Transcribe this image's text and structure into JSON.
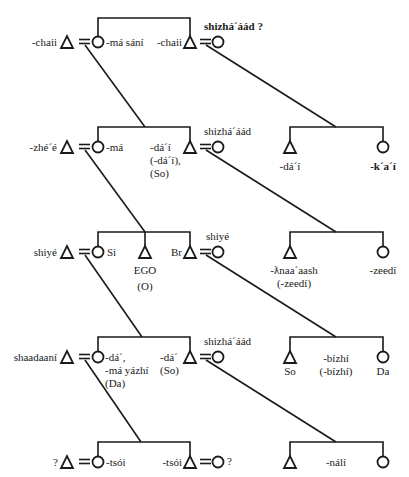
{
  "diagram": {
    "type": "kinship-chart",
    "symbols": {
      "male": "triangle",
      "female": "circle",
      "marriage": "equals-sign"
    },
    "generations": [
      {
        "level": 1,
        "labels": {
          "left_husband": "-chaii",
          "left_wife": "-má sání",
          "right_husband": "-chaii",
          "right_wife_note": "shizhá´áád ?"
        }
      },
      {
        "level": 2,
        "labels": {
          "left_husband": "-zhé´é",
          "left_wife": "-má",
          "brother_line1": "-dá´í",
          "brother_line2": "(-dá´í),",
          "brother_line3": "(So)",
          "brother_wife_note": "shizhá´áád",
          "cousin_male": "-dá´í",
          "cousin_female": "-k´a´í"
        }
      },
      {
        "level": 3,
        "labels": {
          "left_husband": "shiyé",
          "sister": "Si",
          "ego": "EGO",
          "ego_sub": "(O)",
          "brother": "Br",
          "brother_wife_note": "shiyé",
          "cross_male_line1": "-ƛnaa´aash",
          "cross_male_line2": "(-zeedí)",
          "cross_female": "-zeedí"
        }
      },
      {
        "level": 4,
        "labels": {
          "left_husband": "shaadaaní",
          "daughter_line1": "-dá´,",
          "daughter_line2": "-má yázhí",
          "daughter_line3": "(Da)",
          "son_line1": "-dá´",
          "son_line2": "(So)",
          "son_wife_note": "shizhá´áád",
          "right_son": "So",
          "right_middle_line1": "-bízhí",
          "right_middle_line2": "(-bízhí)",
          "right_daughter": "Da"
        }
      },
      {
        "level": 5,
        "labels": {
          "left_husband": "?",
          "left_wife": "-tsói",
          "right_husband": "-tsói",
          "right_wife_note": "?",
          "right_group_middle": "-nálí"
        }
      }
    ]
  }
}
